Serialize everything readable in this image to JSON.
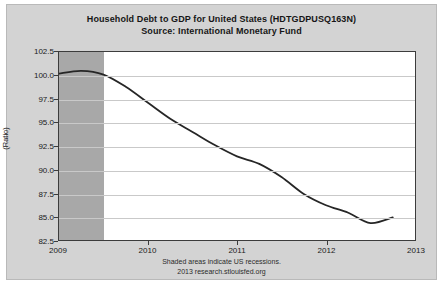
{
  "chart_data": {
    "type": "line",
    "title": "Household Debt to GDP for United States (HDTGDPUSQ163N)",
    "subtitle": "Source: International Monetary Fund",
    "xlabel": "",
    "ylabel": "(Ratio)",
    "ylim": [
      82.5,
      102.5
    ],
    "xlim": [
      2009.0,
      2013.0
    ],
    "grid": true,
    "legend": "none",
    "y_ticks": [
      "102.5",
      "100.0",
      "97.5",
      "95.0",
      "92.5",
      "90.0",
      "87.5",
      "85.0",
      "82.5"
    ],
    "y_tick_values": [
      102.5,
      100.0,
      97.5,
      95.0,
      92.5,
      90.0,
      87.5,
      85.0,
      82.5
    ],
    "x_ticks": [
      "2009",
      "2010",
      "2011",
      "2012",
      "2013"
    ],
    "x_tick_values": [
      2009,
      2010,
      2011,
      2012,
      2013
    ],
    "series": [
      {
        "name": "Household Debt to GDP for United States",
        "color": "#262626",
        "x": [
          2009.0,
          2009.25,
          2009.5,
          2009.75,
          2010.0,
          2010.25,
          2010.5,
          2010.75,
          2011.0,
          2011.25,
          2011.5,
          2011.75,
          2012.0,
          2012.25,
          2012.5,
          2012.75
        ],
        "values": [
          100.2,
          100.5,
          100.1,
          98.8,
          97.1,
          95.4,
          94.0,
          92.6,
          91.4,
          90.6,
          89.2,
          87.4,
          86.2,
          85.4,
          84.3,
          84.9
        ]
      }
    ],
    "shaded_regions": [
      {
        "name": "us-recession",
        "start": 2009.0,
        "end": 2009.5,
        "color": "#a8a8a8",
        "label": "Shaded areas indicate US recessions."
      }
    ],
    "annotations": {
      "recession_note": "Shaded areas indicate US recessions.",
      "source_note": "2013 research.stlouisfed.org"
    }
  }
}
